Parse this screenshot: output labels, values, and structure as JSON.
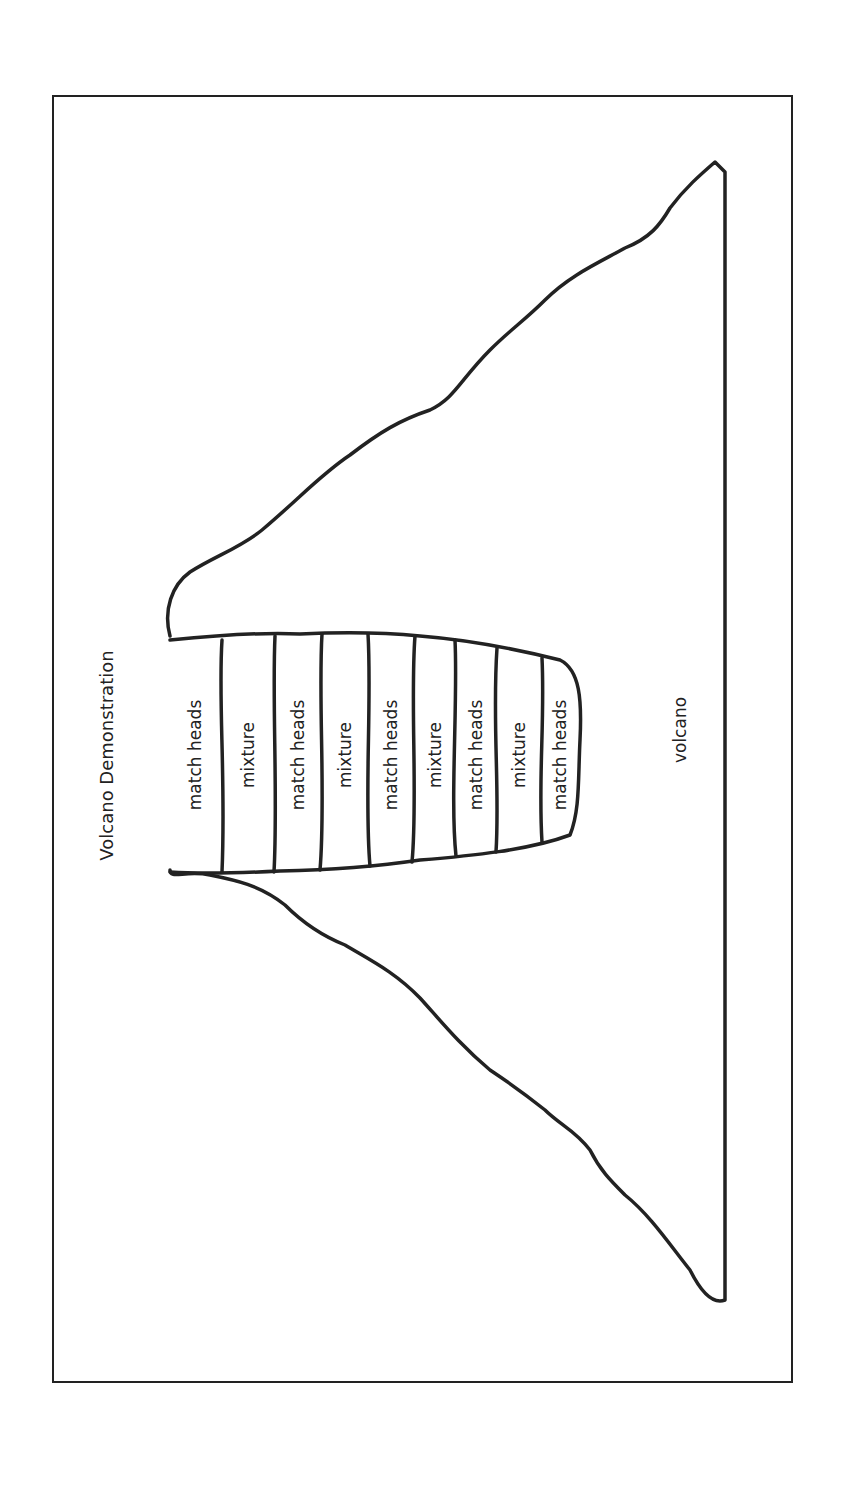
{
  "diagram": {
    "title": "Volcano Demonstration",
    "volcano_label": "volcano",
    "layers": [
      {
        "label": "match heads"
      },
      {
        "label": "mixture"
      },
      {
        "label": "match heads"
      },
      {
        "label": "mixture"
      },
      {
        "label": "match heads"
      },
      {
        "label": "mixture"
      },
      {
        "label": "match heads"
      },
      {
        "label": "mixture"
      },
      {
        "label": "match heads"
      }
    ],
    "orientation": "rotated 90° counter-clockwise",
    "line_color": "#222222"
  }
}
